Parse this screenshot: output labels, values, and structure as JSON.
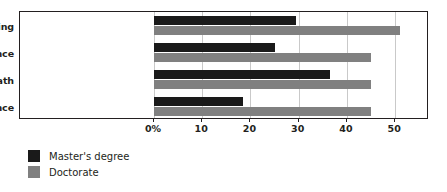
{
  "chart_data": {
    "type": "bar",
    "orientation": "horizontal",
    "title": "",
    "xlabel": "",
    "ylabel": "",
    "categories": [
      "Engineering",
      "Physical Science",
      "Computer Science/Math",
      "Life Science"
    ],
    "series": [
      {
        "name": "Master's degree",
        "color": "#1a1a1a",
        "values": [
          29.5,
          25,
          36.5,
          18.5
        ]
      },
      {
        "name": "Doctorate",
        "color": "#808080",
        "values": [
          51,
          45,
          45,
          45
        ]
      }
    ],
    "xlim": [
      0,
      57
    ],
    "xticks": [
      0,
      10,
      20,
      30,
      40,
      50
    ],
    "xtick_labels": [
      "0%",
      "10",
      "20",
      "30",
      "40",
      "50"
    ],
    "grid": "vertical",
    "legend_position": "below-left",
    "border_color": "#231f20",
    "gridline_color": "#c9c9c9"
  }
}
